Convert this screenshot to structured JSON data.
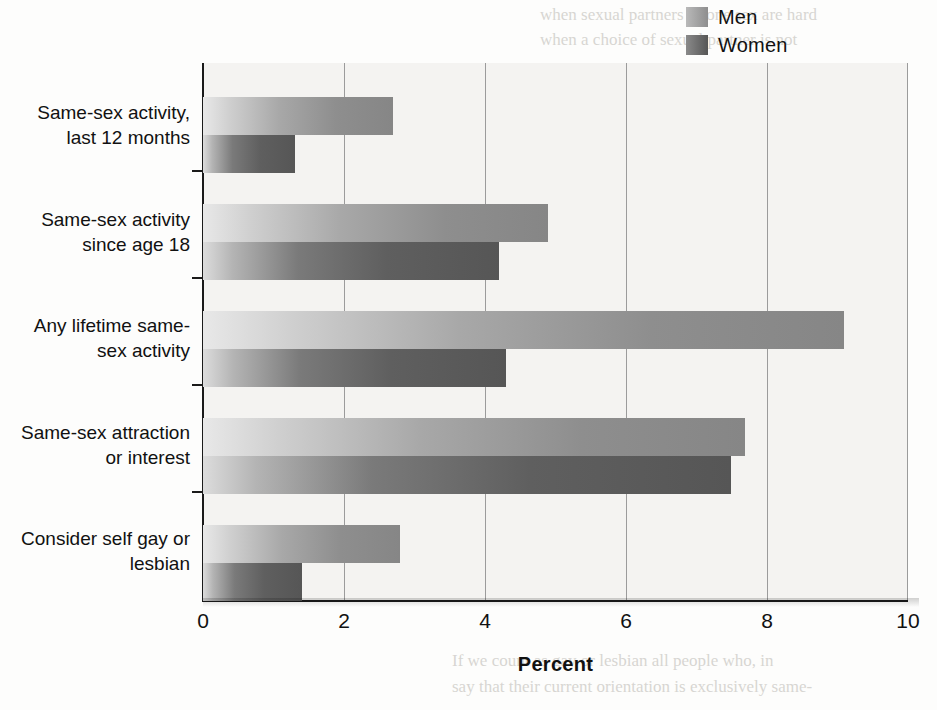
{
  "chart_data": {
    "type": "bar",
    "orientation": "horizontal",
    "title": "",
    "xlabel": "Percent",
    "ylabel": "",
    "xlim": [
      0,
      10
    ],
    "xticks": [
      0,
      2,
      4,
      6,
      8,
      10
    ],
    "xtick_labels": [
      "0",
      "2",
      "4",
      "6",
      "8",
      "10"
    ],
    "grid": true,
    "grid_axis": "x",
    "legend_position": "top-right",
    "categories": [
      "Same-sex activity, last 12 months",
      "Same-sex activity since age 18",
      "Any lifetime same-sex activity",
      "Same-sex attraction or interest",
      "Consider self gay or lesbian"
    ],
    "category_lines": [
      [
        "Same-sex activity,",
        "last 12 months"
      ],
      [
        "Same-sex activity",
        "since age 18"
      ],
      [
        "Any lifetime same-",
        "sex activity"
      ],
      [
        "Same-sex attraction",
        "or interest"
      ],
      [
        "Consider self gay or",
        "lesbian"
      ]
    ],
    "series": [
      {
        "name": "Men",
        "color": "#8e8e8e",
        "values": [
          2.7,
          4.9,
          9.1,
          7.7,
          2.8
        ]
      },
      {
        "name": "Women",
        "color": "#5f5f5f",
        "values": [
          1.3,
          4.2,
          4.3,
          7.5,
          1.4
        ]
      }
    ]
  },
  "legend": {
    "items": [
      {
        "label": "Men",
        "color": "#8e8e8e"
      },
      {
        "label": "Women",
        "color": "#5f5f5f"
      }
    ]
  },
  "axis": {
    "x_title": "Percent",
    "ticks": [
      "0",
      "2",
      "4",
      "6",
      "8",
      "10"
    ]
  },
  "bleed_text": {
    "lines": [
      "when sexual partners of one sex are hard",
      "when a choice of sexual partner is not",
      "Homosexual or bisexual behavior has also been",
      "observed in hundreds of animal species. The",
      "previously assumed that homosexuality occurred",
      "only in captive animals, only in hormonally abnor-",
      "mal animals, or only when partners of the other sex",
      "were unavailable, but the evidence challenges those",
      "assumptions (Bagemihl, 1999). It may be variations",
      "that are likeliest occur in nature, their homosexual-",
      "How many people have a homosexual orienta-",
      "tion? You may have heard claims of 10 percent. That",
      "number comes from Kinsey's research indicating that",
      "10 percent of men and a lesser percentage of women",
      "interviewed in this time had more or less a predom-",
      "inantly homosexual orientation. However, Kinsey",
      "did not have a random or representative sample,",
      "and later surveys have reported lower numbers.",
      "1996), yet national surveys in Europe and the",
      "If we count as gay or lesbian all people who, in",
      "say that their current orientation is exclusively same-"
    ]
  }
}
